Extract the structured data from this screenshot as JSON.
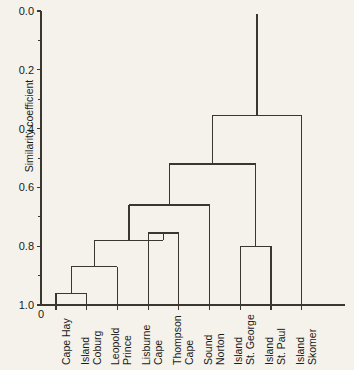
{
  "figure": {
    "title": "",
    "background_color": "#f4f2ea",
    "line_color": "#3a3730"
  },
  "axis": {
    "y_label": "Similarity coefficient",
    "y_ticks": [
      "0.0",
      "0.2",
      "0.4",
      "0.6",
      "0.8",
      "1.0"
    ],
    "y_tick_values": [
      0.0,
      0.2,
      0.4,
      0.6,
      0.8,
      1.0
    ],
    "y_minor_ticks": [
      0.1,
      0.3,
      0.5,
      0.7,
      0.9
    ],
    "origin_label": "0",
    "x_label": ""
  },
  "chart_data": {
    "type": "dendrogram",
    "title": "",
    "xlabel": "",
    "ylabel": "Similarity coefficient",
    "ylim": [
      0.0,
      1.0
    ],
    "y_inverted": true,
    "grid": false,
    "legend": "none",
    "leaves": [
      {
        "index": 0,
        "label": "Cape Hay"
      },
      {
        "index": 1,
        "label": "Coburg Island"
      },
      {
        "index": 2,
        "label": "Prince Leopold"
      },
      {
        "index": 3,
        "label": "Cape Lisburne"
      },
      {
        "index": 4,
        "label": "Cape Thompson"
      },
      {
        "index": 5,
        "label": "Norton Sound"
      },
      {
        "index": 6,
        "label": "St. George Island"
      },
      {
        "index": 7,
        "label": "St. Paul Island"
      },
      {
        "index": 8,
        "label": "Skomer Island"
      }
    ],
    "leaf_labels_line1": [
      "Cape Hay",
      "Coburg",
      "Prince",
      "Cape",
      "Cape",
      "Norton",
      "St. George",
      "St. Paul",
      "Skomer"
    ],
    "leaf_labels_line2": [
      "",
      "Island",
      "Leopold",
      "Lisburne",
      "Thompson",
      "Sound",
      "Island",
      "Island",
      "Island"
    ],
    "merges": [
      {
        "id": "m1",
        "left": "Cape Hay",
        "right": "Coburg Island",
        "height": 0.96
      },
      {
        "id": "m2",
        "left": "m1",
        "right": "Prince Leopold",
        "height": 0.87
      },
      {
        "id": "m3",
        "left": "Cape Lisburne",
        "right": "Cape Thompson",
        "height": 0.755
      },
      {
        "id": "m4",
        "left": "m2",
        "right": "m3",
        "height": 0.78
      },
      {
        "id": "m5",
        "left": "m4",
        "right": "Norton Sound",
        "height": 0.66
      },
      {
        "id": "m6",
        "left": "St. George Island",
        "right": "St. Paul Island",
        "height": 0.8
      },
      {
        "id": "m7",
        "left": "m5",
        "right": "m6",
        "height": 0.52
      },
      {
        "id": "m8",
        "left": "m7",
        "right": "Skomer Island",
        "height": 0.355
      }
    ],
    "root_stem_top": 0.01
  }
}
